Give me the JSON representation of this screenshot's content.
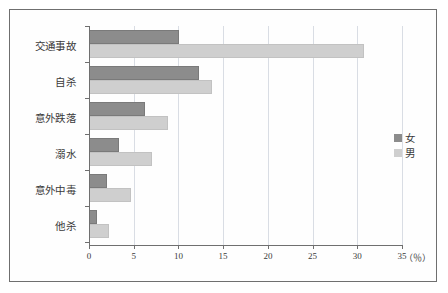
{
  "chart_data": {
    "type": "bar",
    "orientation": "horizontal",
    "title": "",
    "subtitle": "",
    "xlabel": "（％）",
    "ylabel": "",
    "categories": [
      "交通事故",
      "自杀",
      "意外跌落",
      "溺水",
      "意外中毒",
      "他杀"
    ],
    "series": [
      {
        "name": "女",
        "color": "#8c8c8c",
        "values": [
          10.1,
          12.3,
          6.3,
          3.4,
          2.0,
          0.9
        ]
      },
      {
        "name": "男",
        "color": "#cfcfcf",
        "values": [
          30.8,
          13.8,
          8.8,
          7.0,
          4.7,
          2.2
        ]
      }
    ],
    "xlim": [
      0,
      35
    ],
    "xticks": [
      0,
      5,
      10,
      15,
      20,
      25,
      30,
      35
    ],
    "xtick_labels": [
      "0",
      "5",
      "10",
      "15",
      "20",
      "25",
      "30",
      "35"
    ],
    "grid": true,
    "grid_axis": "x",
    "legend_position": "right",
    "legend_entries": [
      "女",
      "男"
    ],
    "unit_note": "（％）"
  },
  "colors": {
    "female": "#8c8c8c",
    "male": "#cfcfcf",
    "axis": "#6f6f6f",
    "grid": "#d9dde4",
    "frame": "#6f6f6f",
    "text": "#3a3a3a",
    "background": "#ffffff"
  }
}
